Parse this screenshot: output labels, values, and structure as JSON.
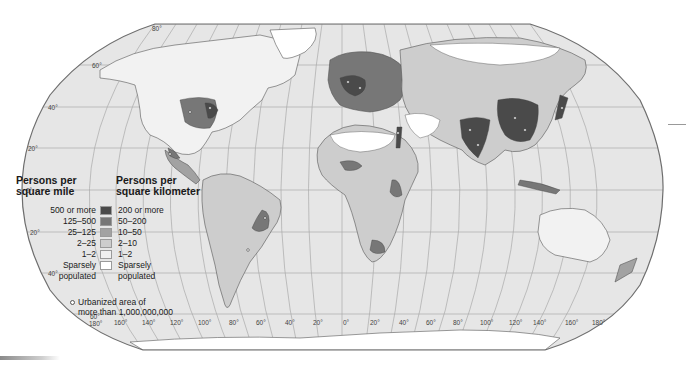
{
  "map": {
    "title": "World population density",
    "projection": "Robinson",
    "colors": {
      "ocean": "#e6e6e6",
      "frame": "#6e6e6e",
      "graticule": "#a9a9a9",
      "class_200_or_more": "#4a4a4a",
      "class_50_200": "#777777",
      "class_10_50": "#a2a2a2",
      "class_2_10": "#cdcdcd",
      "class_1_2": "#f0f0f0",
      "class_sparse": "#ffffff",
      "coastline": "#555555"
    },
    "latitude_labels": [
      {
        "label": "80°",
        "x": 152,
        "y": 29
      },
      {
        "label": "60°",
        "x": 92,
        "y": 67
      },
      {
        "label": "40°",
        "x": 48,
        "y": 109
      },
      {
        "label": "20°",
        "x": 28,
        "y": 150
      },
      {
        "label": "0°",
        "x": 25,
        "y": 192
      },
      {
        "label": "20°",
        "x": 30,
        "y": 235
      },
      {
        "label": "40°",
        "x": 48,
        "y": 275
      },
      {
        "label": "60°",
        "x": 90,
        "y": 316
      }
    ],
    "longitude_labels": [
      {
        "label": "180°",
        "x": 89,
        "y": 323
      },
      {
        "label": "160°",
        "x": 114,
        "y": 322
      },
      {
        "label": "140°",
        "x": 142,
        "y": 322
      },
      {
        "label": "120°",
        "x": 170,
        "y": 322
      },
      {
        "label": "100°",
        "x": 198,
        "y": 322
      },
      {
        "label": "80°",
        "x": 229,
        "y": 322
      },
      {
        "label": "60°",
        "x": 256,
        "y": 322
      },
      {
        "label": "40°",
        "x": 285,
        "y": 322
      },
      {
        "label": "20°",
        "x": 313,
        "y": 322
      },
      {
        "label": "0°",
        "x": 343,
        "y": 322
      },
      {
        "label": "20°",
        "x": 370,
        "y": 322
      },
      {
        "label": "40°",
        "x": 399,
        "y": 322
      },
      {
        "label": "60°",
        "x": 426,
        "y": 322
      },
      {
        "label": "80°",
        "x": 453,
        "y": 322
      },
      {
        "label": "100°",
        "x": 480,
        "y": 322
      },
      {
        "label": "120°",
        "x": 509,
        "y": 322
      },
      {
        "label": "140°",
        "x": 533,
        "y": 322
      },
      {
        "label": "160°",
        "x": 565,
        "y": 322
      },
      {
        "label": "180°",
        "x": 592,
        "y": 322
      }
    ]
  },
  "legend": {
    "heading_mile": "Persons per square mile",
    "heading_mile_line1": "Persons per",
    "heading_mile_line2": "square mile",
    "heading_km_line1": "Persons per",
    "heading_km_line2": "square kilometer",
    "classes": [
      {
        "per_mile": "500 or more",
        "per_km": "200 or more",
        "color": "#4a4a4a"
      },
      {
        "per_mile": "125–500",
        "per_km": "50–200",
        "color": "#777777"
      },
      {
        "per_mile": "25–125",
        "per_km": "10–50",
        "color": "#a2a2a2"
      },
      {
        "per_mile": "2–25",
        "per_km": "2–10",
        "color": "#cdcdcd"
      },
      {
        "per_mile": "1–2",
        "per_km": "1–2",
        "color": "#f0f0f0"
      },
      {
        "per_mile_line1": "Sparsely",
        "per_mile_line2": "populated",
        "per_km_line1": "Sparsely",
        "per_km_line2": "populated",
        "color": "#ffffff"
      }
    ],
    "urban_line1": "Urbanized area of",
    "urban_line2": "more than 1,000,000,000"
  }
}
